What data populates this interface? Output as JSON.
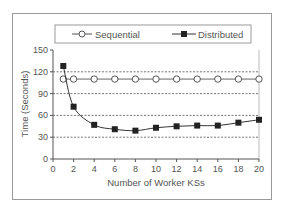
{
  "chart_data": {
    "type": "line",
    "title": "",
    "xlabel": "Number of Worker KSs",
    "ylabel": "Time (Seconds)",
    "xlim": [
      0,
      20
    ],
    "ylim": [
      0,
      150
    ],
    "xticks": [
      0,
      2,
      4,
      6,
      8,
      10,
      12,
      14,
      16,
      18,
      20
    ],
    "yticks": [
      0,
      30,
      60,
      90,
      120,
      150
    ],
    "grid": "horizontal dashed",
    "legend_position": "top",
    "x": [
      1,
      2,
      4,
      6,
      8,
      10,
      12,
      14,
      16,
      18,
      20
    ],
    "series": [
      {
        "name": "Sequential",
        "marker": "open-circle",
        "color": "#555555",
        "values": [
          110,
          110,
          110,
          110,
          110,
          110,
          110,
          110,
          110,
          110,
          110
        ]
      },
      {
        "name": "Distributed",
        "marker": "filled-square",
        "color": "#222222",
        "values": [
          128,
          72,
          47,
          41,
          39,
          43,
          45,
          46,
          46,
          50,
          54
        ]
      }
    ]
  },
  "legend": {
    "sequential_label": "Sequential",
    "distributed_label": "Distributed"
  },
  "axes": {
    "x_title": "Number of Worker KSs",
    "y_title": "Time (Seconds)"
  }
}
